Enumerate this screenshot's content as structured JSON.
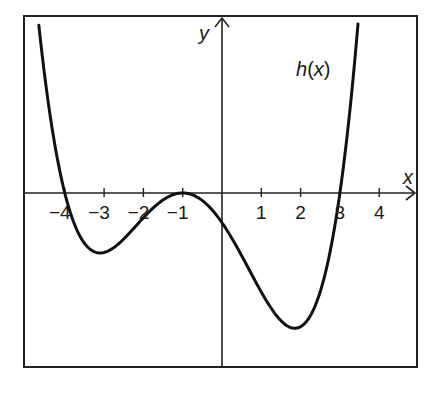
{
  "chart_data": {
    "type": "line",
    "title": "",
    "xlabel": "x",
    "ylabel": "y",
    "function_label_name": "h",
    "function_label_arg": "(x)",
    "x_ticks": [
      -4,
      -3,
      -2,
      -1,
      1,
      2,
      3,
      4
    ],
    "x_tick_labels": [
      "−4",
      "−3",
      "−2",
      "−1",
      "1",
      "2",
      "3",
      "4"
    ],
    "y_ticks": [],
    "grid": false,
    "legend": null,
    "xlim": [
      -5.0,
      5.0
    ],
    "ylim": [
      -4.4,
      4.5
    ],
    "function": {
      "name": "h(x)",
      "form": "k*(x+4)*(x+1)^2*(x-3)",
      "k": 0.063,
      "roots": [
        -4,
        -1,
        -1,
        3
      ],
      "x_range": [
        -4.66,
        3.46
      ]
    },
    "key_points": [
      {
        "label": "root",
        "x": -4,
        "y": 0
      },
      {
        "label": "local min",
        "x": -3.15,
        "y": -1.52
      },
      {
        "label": "double root / local max",
        "x": -1,
        "y": 0
      },
      {
        "label": "y-intercept",
        "x": 0,
        "y": -0.76
      },
      {
        "label": "local min",
        "x": 1.84,
        "y": -3.5
      },
      {
        "label": "root",
        "x": 3,
        "y": 0
      }
    ],
    "colors": {
      "curve": "#111111",
      "axes": "#222222",
      "frame": "#222222"
    }
  }
}
